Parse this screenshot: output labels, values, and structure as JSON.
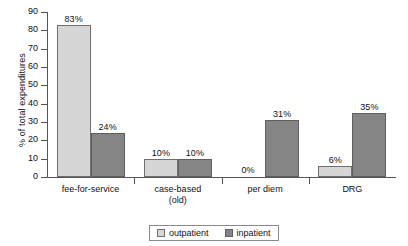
{
  "chart_data": {
    "type": "bar",
    "title": "",
    "xlabel": "",
    "ylabel": "% of total expenditures",
    "ylim": [
      0,
      90
    ],
    "ytick_step": 10,
    "yticks": [
      90,
      80,
      70,
      60,
      50,
      40,
      30,
      20,
      10,
      0
    ],
    "grid": false,
    "legend_position": "bottom-center",
    "categories": [
      "fee-for-service",
      "case-based (old)",
      "per diem",
      "DRG"
    ],
    "category_lines": [
      [
        "fee-for-service"
      ],
      [
        "case-based",
        "(old)"
      ],
      [
        "per diem"
      ],
      [
        "DRG"
      ]
    ],
    "series": [
      {
        "name": "outpatient",
        "color": "#d6d6d6",
        "values": [
          83,
          10,
          0,
          6
        ],
        "labels": [
          "83%",
          "10%",
          "0%",
          "6%"
        ]
      },
      {
        "name": "inpatient",
        "color": "#858585",
        "values": [
          24,
          10,
          31,
          35
        ],
        "labels": [
          "24%",
          "10%",
          "31%",
          "35%"
        ]
      }
    ]
  },
  "axis": {
    "y_title": "% of total expenditures",
    "y_tick_labels": [
      "90",
      "80",
      "70",
      "60",
      "50",
      "40",
      "30",
      "20",
      "10",
      "0"
    ]
  },
  "legend": {
    "items": [
      {
        "label": "outpatient",
        "swatch": "legend-swatch-outpatient"
      },
      {
        "label": "inpatient",
        "swatch": "legend-swatch-inpatient"
      }
    ]
  },
  "colors": {
    "outpatient": "#d6d6d6",
    "inpatient": "#858585",
    "axis": "#555555",
    "text": "#111111",
    "background": "#ffffff"
  }
}
